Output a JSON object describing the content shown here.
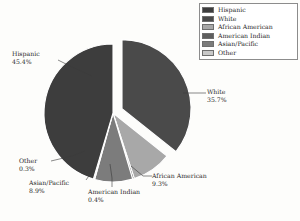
{
  "chart_data": {
    "type": "pie",
    "title": "",
    "categories": [
      "Hispanic",
      "White",
      "African American",
      "American Indian",
      "Asian/Pacific",
      "Other"
    ],
    "values": [
      45.4,
      35.7,
      9.3,
      0.4,
      8.9,
      0.3
    ],
    "value_suffix": "%",
    "exploded": [
      "White"
    ],
    "legend_position": "top-right",
    "grid": false,
    "colors": [
      "#3d3d3d",
      "#4a4a4a",
      "#a8a8a8",
      "#5e5e5e",
      "#7c7c7c",
      "#c9c9c9"
    ],
    "labels": [
      {
        "name": "Hispanic",
        "value": "45.4%"
      },
      {
        "name": "White",
        "value": "35.7%"
      },
      {
        "name": "African American",
        "value": "9.3%"
      },
      {
        "name": "American Indian",
        "value": "0.4%"
      },
      {
        "name": "Asian/Pacific",
        "value": "8.9%"
      },
      {
        "name": "Other",
        "value": "0.3%"
      }
    ]
  },
  "legend": {
    "items": [
      {
        "label": "Hispanic",
        "color": "#3d3d3d"
      },
      {
        "label": "White",
        "color": "#4a4a4a"
      },
      {
        "label": "African American",
        "color": "#a8a8a8"
      },
      {
        "label": "American Indian",
        "color": "#5e5e5e"
      },
      {
        "label": "Asian/Pacific",
        "color": "#7c7c7c"
      },
      {
        "label": "Other",
        "color": "#c9c9c9"
      }
    ]
  },
  "caption": ""
}
